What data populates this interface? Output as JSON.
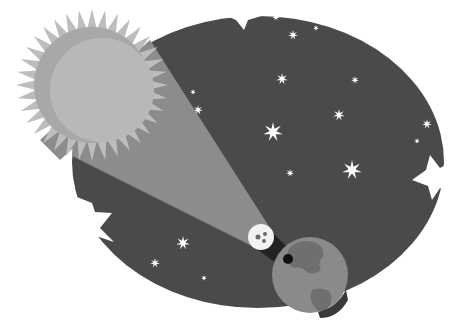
{
  "scene": {
    "title": "Solar eclipse illustration",
    "description": "Sun casting a light beam toward the Moon, whose shadow falls on Earth, against a starry night sky",
    "colors": {
      "background": "#ffffff",
      "sky": "#4a4a4a",
      "sun_rays": "#bdbdbd",
      "sun_outer": "#a8a8a8",
      "sun_inner": "#b8b8b8",
      "beam": "#8c8c8c",
      "moon": "#f2f2f2",
      "moon_craters": "#6a6a6a",
      "shadow": "#111111",
      "earth_ocean": "#8a8a8a",
      "earth_land": "#6f6f6f",
      "stars": "#ffffff"
    },
    "elements": {
      "sun": {
        "cx": 92,
        "cy": 85,
        "r": 58
      },
      "moon": {
        "cx": 261,
        "cy": 237,
        "r": 13
      },
      "earth": {
        "cx": 310,
        "cy": 275,
        "r": 38
      },
      "sky": {
        "cx": 255,
        "cy": 160,
        "rx": 185,
        "ry": 145
      }
    },
    "stars": [
      {
        "x": 276,
        "y": 17,
        "s": 4
      },
      {
        "x": 293,
        "y": 35,
        "s": 5
      },
      {
        "x": 316,
        "y": 28,
        "s": 3
      },
      {
        "x": 282,
        "y": 79,
        "s": 6
      },
      {
        "x": 355,
        "y": 80,
        "s": 4
      },
      {
        "x": 339,
        "y": 115,
        "s": 6
      },
      {
        "x": 273,
        "y": 132,
        "s": 10
      },
      {
        "x": 352,
        "y": 170,
        "s": 10
      },
      {
        "x": 290,
        "y": 173,
        "s": 4
      },
      {
        "x": 427,
        "y": 124,
        "s": 5
      },
      {
        "x": 417,
        "y": 141,
        "s": 3
      },
      {
        "x": 193,
        "y": 92,
        "s": 3
      },
      {
        "x": 198,
        "y": 110,
        "s": 5
      },
      {
        "x": 183,
        "y": 243,
        "s": 7
      },
      {
        "x": 155,
        "y": 263,
        "s": 5
      },
      {
        "x": 204,
        "y": 278,
        "s": 3
      }
    ]
  }
}
